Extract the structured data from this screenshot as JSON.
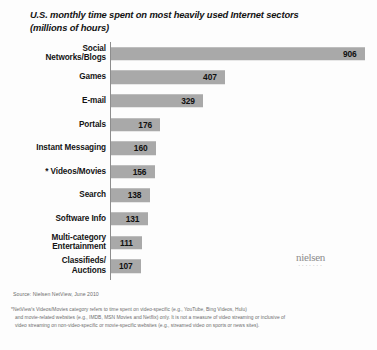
{
  "chart_data": {
    "type": "bar",
    "orientation": "horizontal",
    "title": "U.S. monthly time spent on most heavily used Internet sectors (millions of hours)",
    "title_lines": [
      "U.S. monthly time spent on most heavily used Internet sectors",
      "(millions of hours)"
    ],
    "xlabel": "",
    "ylabel": "",
    "xlim": [
      0,
      906
    ],
    "grid": false,
    "legend": "none",
    "units": "millions of hours",
    "categories": [
      "Social Networks/Blogs",
      "Games",
      "E-mail",
      "Portals",
      "Instant Messaging",
      "*Videos/Movies",
      "Search",
      "Software Info",
      "Multi-category Entertainment",
      "Classifieds/Auctions"
    ],
    "values": [
      906,
      407,
      329,
      176,
      160,
      156,
      138,
      131,
      111,
      107
    ],
    "bars": [
      {
        "label": "Social\nNetworks/Blogs",
        "value": 906,
        "value_text": "906"
      },
      {
        "label": "Games",
        "value": 407,
        "value_text": "407"
      },
      {
        "label": "E-mail",
        "value": 329,
        "value_text": "329"
      },
      {
        "label": "Portals",
        "value": 176,
        "value_text": "176"
      },
      {
        "label": "Instant Messaging",
        "value": 160,
        "value_text": "160"
      },
      {
        "label": "* Videos/Movies",
        "value": 156,
        "value_text": "156"
      },
      {
        "label": "Search",
        "value": 138,
        "value_text": "138"
      },
      {
        "label": "Software Info",
        "value": 131,
        "value_text": "131"
      },
      {
        "label": "Multi-category\nEntertainment",
        "value": 111,
        "value_text": "111"
      },
      {
        "label": "Classifieds/\nAuctions",
        "value": 107,
        "value_text": "107"
      }
    ],
    "colors": {
      "bar_fill": "#a9a9a9",
      "axis_line": "#8d8d8d",
      "text": "#141414",
      "footnote_text": "#6d6d6d",
      "background": "#fdfdfd",
      "logo": "#8c8c8c"
    }
  },
  "source": {
    "text": "Source: Nielsen NetView, June 2010"
  },
  "footnote": {
    "lines": [
      "*NetView's Videos/Movies category refers to time spent on video-specific (e.g., YouTube, Bing Videos, Hulu)",
      "and movie-related websites (e.g., IMDB, MSN Movies and Netflix) only. It is not a measure of video streaming or inclusive of",
      "video streaming on non-video-specific or movie-specific websites (e.g., streamed video on sports or news sites)."
    ]
  },
  "logo": {
    "wordmark": "nielsen",
    "tagline": "▪ ▪ ▪ ▪ ▪ ▪ ▪"
  }
}
